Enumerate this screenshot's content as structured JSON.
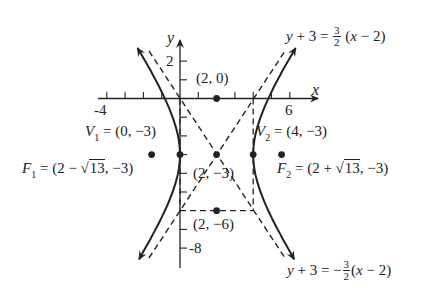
{
  "diagram": {
    "type": "hyperbola-graph",
    "equation_standard_form": "(x-2)^2/4 - (y+3)^2/9 = 1",
    "axes": {
      "x_label": "x",
      "y_label": "y",
      "x_ticks_labeled": [
        "-4",
        "6"
      ],
      "y_ticks_labeled": [
        "2",
        "-8"
      ],
      "x_range": [
        -4,
        6
      ],
      "y_range": [
        -8,
        2
      ]
    },
    "points": {
      "center": {
        "label": "(2, −3)",
        "x": 2,
        "y": -3
      },
      "top_box": {
        "label": "(2, 0)",
        "x": 2,
        "y": 0
      },
      "bottom_box": {
        "label": "(2, −6)",
        "x": 2,
        "y": -6
      },
      "vertex1": {
        "name": "V",
        "sub": "1",
        "value": " = (0, −3)",
        "x": 0,
        "y": -3
      },
      "vertex2": {
        "name": "V",
        "sub": "2",
        "value": " = (4, −3)",
        "x": 4,
        "y": -3
      },
      "focus1": {
        "name": "F",
        "sub": "1",
        "value_pre": " = (2 − ",
        "sqrt": "13",
        "value_post": ", −3)",
        "x": -1.606,
        "y": -3
      },
      "focus2": {
        "name": "F",
        "sub": "2",
        "value_pre": " = (2 + ",
        "sqrt": "13",
        "value_post": ", −3)",
        "x": 5.606,
        "y": -3
      }
    },
    "asymptotes": {
      "upper": {
        "lhs_var": "y",
        "lhs_rest": " + 3 = ",
        "sign": "",
        "num": "3",
        "den": "2",
        "rhs_open": " (",
        "rhs_var": "x",
        "rhs_rest": " − 2)"
      },
      "lower": {
        "lhs_var": "y",
        "lhs_rest": " + 3 = ",
        "sign": "−",
        "num": "3",
        "den": "2",
        "rhs_open": "(",
        "rhs_var": "x",
        "rhs_rest": " − 2)"
      }
    },
    "colors": {
      "ink": "#222222",
      "background": "#ffffff"
    }
  }
}
